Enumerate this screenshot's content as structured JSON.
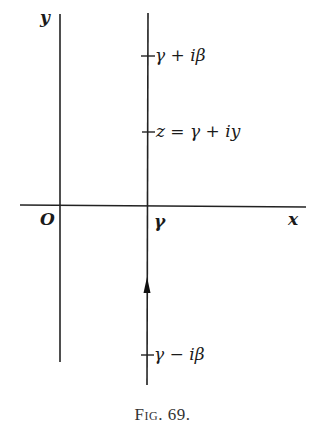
{
  "figure": {
    "axes": {
      "x_label": "x",
      "y_label": "y",
      "origin_label": "O"
    },
    "contour": {
      "foot_label": "γ",
      "points": [
        {
          "name": "upper",
          "label": "γ + iβ"
        },
        {
          "name": "general",
          "label": "z = γ + iy"
        },
        {
          "name": "lower",
          "label": "γ − iβ"
        }
      ],
      "direction": "upward"
    },
    "caption": "Fig. 69."
  }
}
